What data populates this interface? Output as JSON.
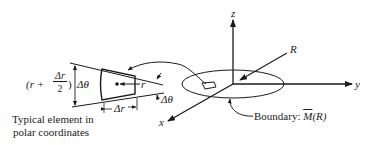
{
  "diagram": {
    "axes": {
      "z_label": "z",
      "y_label": "y",
      "x_label": "x"
    },
    "radius_label": "R",
    "boundary_label": "Boundary: ",
    "boundary_symbol": "M",
    "boundary_arg": "(R)",
    "element": {
      "height_prefix": "(r +",
      "frac_num": "Δr",
      "frac_den": "2",
      "height_suffix": ")",
      "delta_theta_left": "Δθ",
      "delta_theta_right": "Δθ",
      "radial_width": "Δr",
      "r_label": "r"
    },
    "caption_line1": "Typical element in",
    "caption_line2": "polar coordinates"
  },
  "colors": {
    "ink": "#1a1a1a",
    "background": "#ffffff"
  }
}
